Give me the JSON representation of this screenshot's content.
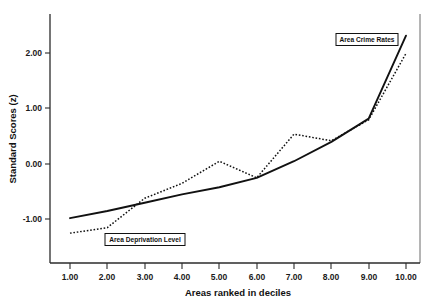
{
  "chart_data": {
    "type": "line",
    "title": "",
    "xlabel": "Areas ranked in deciles",
    "ylabel": "Standard Scores (z)",
    "x": [
      1,
      2,
      3,
      4,
      5,
      6,
      7,
      8,
      9,
      10
    ],
    "xtick_labels": [
      "1.00",
      "2.00",
      "3.00",
      "4.00",
      "5.00",
      "6.00",
      "7.00",
      "8.00",
      "9.00",
      "10.00"
    ],
    "ytick_labels": [
      "2.00",
      "1.00",
      "0.00",
      "-1.00"
    ],
    "ytick_values": [
      2.0,
      1.0,
      0.0,
      -1.0
    ],
    "xlim": [
      0.6,
      10.5
    ],
    "ylim": [
      -1.75,
      2.55
    ],
    "grid": false,
    "legend_position": "inline-annotations",
    "series": [
      {
        "name": "Area Crime Rates",
        "style": "solid",
        "color": "#111111",
        "values": [
          -0.98,
          -0.85,
          -0.7,
          -0.55,
          -0.42,
          -0.25,
          0.05,
          0.4,
          0.82,
          2.32
        ]
      },
      {
        "name": "Area Deprivation Level",
        "style": "dotted",
        "color": "#111111",
        "values": [
          -1.25,
          -1.15,
          -0.62,
          -0.35,
          0.05,
          -0.25,
          0.54,
          0.42,
          0.8,
          2.0
        ]
      }
    ],
    "annotations": [
      {
        "text": "Area Crime Rates",
        "x": 9.05,
        "y": 2.02
      },
      {
        "text": "Area Deprivation Level",
        "x": 2.25,
        "y": -1.42
      }
    ]
  },
  "axes": {
    "x_title": "Areas ranked in deciles",
    "y_title": "Standard Scores (z)"
  },
  "labels": {
    "crime": "Area Crime Rates",
    "deprivation": "Area Deprivation Level"
  },
  "ticks": {
    "x": [
      "1.00",
      "2.00",
      "3.00",
      "4.00",
      "5.00",
      "6.00",
      "7.00",
      "8.00",
      "9.00",
      "10.00"
    ],
    "y": [
      "2.00",
      "1.00",
      "0.00",
      "-1.00"
    ]
  }
}
